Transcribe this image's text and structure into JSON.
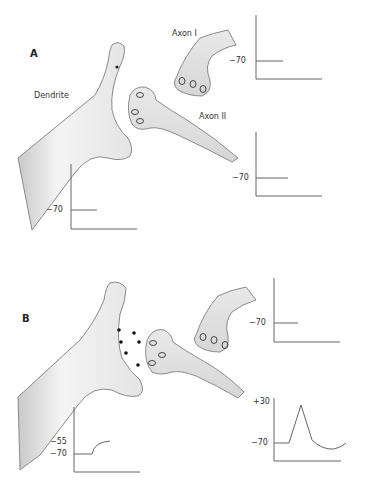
{
  "panels": [
    {
      "id": "A",
      "label": "A",
      "structures": {
        "dendrite_label": "Dendrite",
        "axon1_label": "Axon I",
        "axon2_label": "Axon II"
      },
      "traces": {
        "axon1": {
          "ticks": [
            "−70"
          ],
          "values_mV": [
            -70
          ],
          "shape": "flat resting potential"
        },
        "axon2": {
          "ticks": [
            "−70"
          ],
          "values_mV": [
            -70
          ],
          "shape": "flat resting potential"
        },
        "dendrite": {
          "ticks": [
            "−70"
          ],
          "values_mV": [
            -70
          ],
          "shape": "flat resting potential"
        }
      }
    },
    {
      "id": "B",
      "label": "B",
      "transmitter_dots": 7,
      "traces": {
        "axon1": {
          "ticks": [
            "−70"
          ],
          "values_mV": [
            -70
          ],
          "shape": "flat resting potential"
        },
        "axon2": {
          "ticks": [
            "+30",
            "−70"
          ],
          "values_mV": [
            -70,
            30,
            -70,
            -75,
            -70
          ],
          "shape": "action potential with after-hyperpolarization"
        },
        "dendrite": {
          "ticks": [
            "−55",
            "−70"
          ],
          "values_mV": [
            -70,
            -55
          ],
          "shape": "graded depolarization (EPSP)"
        }
      }
    }
  ],
  "colors": {
    "ink": "#333333",
    "axis": "#555555",
    "shade": "#9a9a9a",
    "fill": "#f2f2f2"
  }
}
